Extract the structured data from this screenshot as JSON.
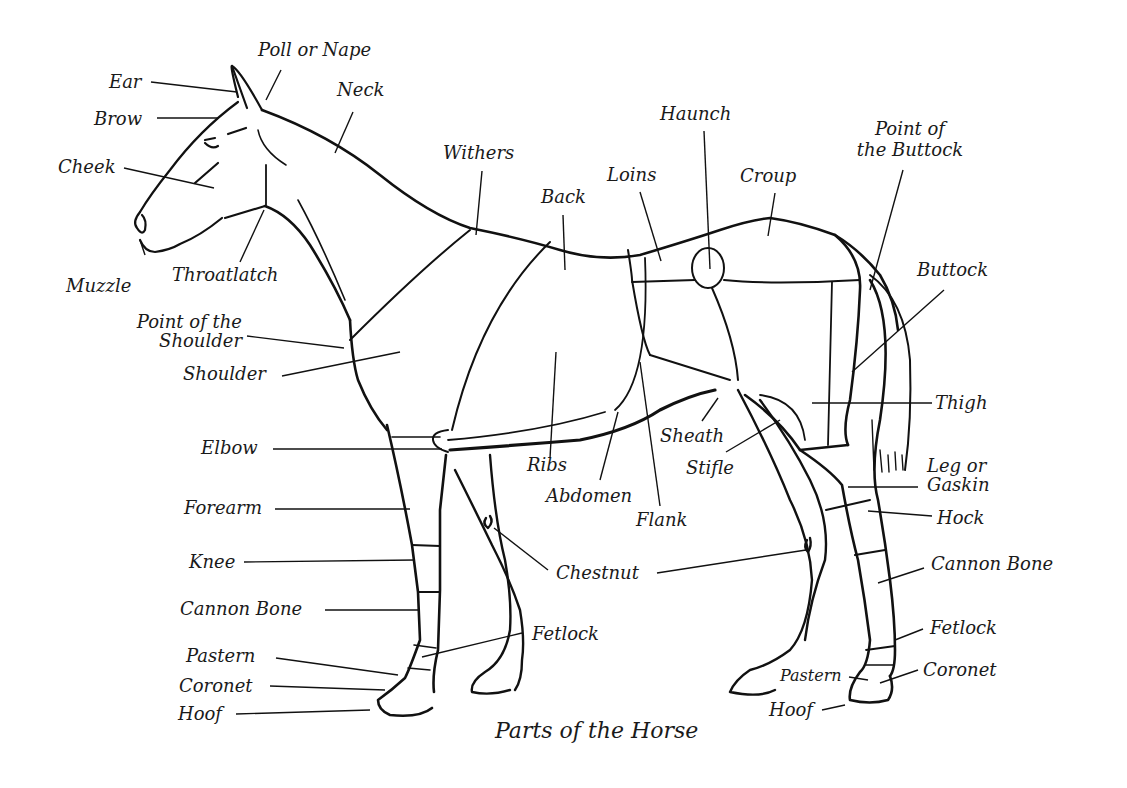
{
  "diagram": {
    "title": "Parts of the Horse",
    "line_color": "#111111",
    "background": "#ffffff",
    "labels": {
      "ear": "Ear",
      "poll": "Poll or Nape",
      "neck": "Neck",
      "brow": "Brow",
      "cheek": "Cheek",
      "muzzle": "Muzzle",
      "throatlatch": "Throatlatch",
      "withers": "Withers",
      "back": "Back",
      "loins": "Loins",
      "haunch": "Haunch",
      "croup": "Croup",
      "point_of_buttock_1": "Point of",
      "point_of_buttock_2": "the Buttock",
      "buttock": "Buttock",
      "point_of_shoulder_1": "Point of the",
      "point_of_shoulder_2": "Shoulder",
      "shoulder": "Shoulder",
      "thigh": "Thigh",
      "elbow": "Elbow",
      "ribs": "Ribs",
      "sheath": "Sheath",
      "stifle": "Stifle",
      "abdomen": "Abdomen",
      "flank": "Flank",
      "gaskin_1": "Leg or",
      "gaskin_2": "Gaskin",
      "hock": "Hock",
      "forearm": "Forearm",
      "knee": "Knee",
      "chestnut": "Chestnut",
      "cannon_front": "Cannon Bone",
      "cannon_hind": "Cannon Bone",
      "fetlock_front": "Fetlock",
      "fetlock_hind": "Fetlock",
      "pastern_front": "Pastern",
      "pastern_hind": "Pastern",
      "coronet_front": "Coronet",
      "coronet_hind": "Coronet",
      "hoof_front": "Hoof",
      "hoof_hind": "Hoof"
    }
  }
}
